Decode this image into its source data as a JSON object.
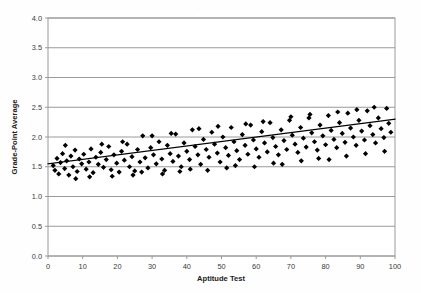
{
  "chart_data": {
    "type": "scatter",
    "title": "",
    "xlabel": "Aptitude Test",
    "ylabel": "Grade-Point Average",
    "xlim": [
      0,
      100
    ],
    "ylim": [
      0,
      4.0
    ],
    "xticks": [
      0,
      10,
      20,
      30,
      40,
      50,
      60,
      70,
      80,
      90,
      100
    ],
    "xtick_labels": [
      "0",
      "10",
      "20",
      "30",
      "40",
      "50",
      "60",
      "70",
      "80",
      "90",
      "100"
    ],
    "yticks": [
      0.0,
      0.5,
      1.0,
      1.5,
      2.0,
      2.5,
      3.0,
      3.5,
      4.0
    ],
    "ytick_labels": [
      "0.0",
      "0.5",
      "1.0",
      "1.5",
      "2.0",
      "2.5",
      "3.0",
      "3.5",
      "4.0"
    ],
    "grid": {
      "horizontal": true,
      "vertical": false,
      "color": "#9a9a9a"
    },
    "legend": {
      "visible": false,
      "position": "none"
    },
    "marker": {
      "shape": "diamond",
      "color": "#000000",
      "size": 2.6
    },
    "plot_border_color": "#9a9a9a",
    "background_color": "#ffffff",
    "trendline": {
      "visible": true,
      "type": "linear",
      "color": "#000000",
      "width": 1.1,
      "x_start": 0,
      "y_start": 1.55,
      "x_end": 100,
      "y_end": 2.3,
      "slope": 0.0075,
      "intercept": 1.55
    },
    "series": [
      {
        "name": "Students",
        "n_points": 162,
        "points": [
          [
            1.5,
            1.52
          ],
          [
            2.0,
            1.44
          ],
          [
            2.6,
            1.64
          ],
          [
            3.1,
            1.38
          ],
          [
            3.6,
            1.57
          ],
          [
            4.2,
            1.72
          ],
          [
            4.8,
            1.47
          ],
          [
            5.4,
            1.6
          ],
          [
            6.0,
            1.36
          ],
          [
            6.6,
            1.68
          ],
          [
            7.2,
            1.5
          ],
          [
            7.8,
            1.78
          ],
          [
            8.4,
            1.42
          ],
          [
            9.0,
            1.63
          ],
          [
            9.7,
            1.55
          ],
          [
            10.3,
            1.71
          ],
          [
            11.0,
            1.46
          ],
          [
            11.8,
            1.58
          ],
          [
            12.4,
            1.8
          ],
          [
            13.0,
            1.4
          ],
          [
            13.8,
            1.66
          ],
          [
            14.5,
            1.54
          ],
          [
            15.2,
            1.74
          ],
          [
            16.0,
            1.49
          ],
          [
            16.8,
            1.62
          ],
          [
            17.5,
            1.84
          ],
          [
            18.2,
            1.45
          ],
          [
            19.0,
            1.7
          ],
          [
            19.8,
            1.56
          ],
          [
            20.5,
            1.41
          ],
          [
            21.2,
            1.76
          ],
          [
            22.0,
            1.61
          ],
          [
            22.8,
            1.88
          ],
          [
            23.5,
            1.5
          ],
          [
            24.2,
            1.67
          ],
          [
            25.0,
            1.43
          ],
          [
            25.8,
            1.79
          ],
          [
            26.5,
            1.58
          ],
          [
            27.3,
            2.02
          ],
          [
            28.0,
            1.65
          ],
          [
            28.8,
            1.48
          ],
          [
            29.6,
            1.82
          ],
          [
            30.4,
            1.7
          ],
          [
            31.2,
            1.55
          ],
          [
            32.0,
            1.92
          ],
          [
            32.8,
            1.63
          ],
          [
            33.6,
            1.44
          ],
          [
            34.4,
            1.86
          ],
          [
            35.2,
            1.72
          ],
          [
            36.0,
            1.59
          ],
          [
            36.8,
            2.05
          ],
          [
            37.6,
            1.68
          ],
          [
            38.4,
            1.5
          ],
          [
            39.2,
            1.9
          ],
          [
            40.0,
            1.76
          ],
          [
            40.8,
            1.62
          ],
          [
            41.6,
            2.12
          ],
          [
            42.4,
            1.84
          ],
          [
            43.2,
            1.7
          ],
          [
            44.0,
            1.54
          ],
          [
            44.8,
            1.96
          ],
          [
            45.6,
            1.79
          ],
          [
            46.4,
            1.66
          ],
          [
            47.2,
            2.08
          ],
          [
            48.0,
            1.88
          ],
          [
            48.8,
            1.73
          ],
          [
            49.6,
            1.58
          ],
          [
            50.4,
            2.0
          ],
          [
            51.2,
            1.82
          ],
          [
            52.0,
            1.69
          ],
          [
            52.8,
            2.16
          ],
          [
            53.6,
            1.92
          ],
          [
            54.4,
            1.77
          ],
          [
            55.2,
            1.62
          ],
          [
            56.0,
            2.04
          ],
          [
            56.8,
            1.86
          ],
          [
            57.6,
            1.71
          ],
          [
            58.4,
            2.2
          ],
          [
            59.2,
            1.95
          ],
          [
            60.0,
            1.8
          ],
          [
            60.8,
            1.66
          ],
          [
            61.6,
            2.09
          ],
          [
            62.4,
            1.9
          ],
          [
            63.2,
            1.75
          ],
          [
            64.0,
            2.24
          ],
          [
            64.8,
            1.99
          ],
          [
            65.6,
            1.84
          ],
          [
            66.4,
            1.7
          ],
          [
            67.2,
            2.12
          ],
          [
            68.0,
            1.94
          ],
          [
            68.8,
            1.79
          ],
          [
            69.6,
            2.28
          ],
          [
            70.4,
            2.03
          ],
          [
            71.2,
            1.88
          ],
          [
            72.0,
            1.74
          ],
          [
            72.8,
            2.16
          ],
          [
            73.6,
            1.98
          ],
          [
            74.4,
            1.83
          ],
          [
            75.2,
            2.32
          ],
          [
            76.0,
            2.07
          ],
          [
            76.8,
            1.92
          ],
          [
            77.6,
            1.78
          ],
          [
            78.4,
            2.2
          ],
          [
            79.2,
            2.02
          ],
          [
            80.0,
            1.87
          ],
          [
            80.8,
            2.36
          ],
          [
            81.6,
            2.11
          ],
          [
            82.4,
            1.96
          ],
          [
            83.2,
            1.82
          ],
          [
            84.0,
            2.24
          ],
          [
            84.8,
            2.06
          ],
          [
            85.6,
            1.91
          ],
          [
            86.4,
            2.4
          ],
          [
            87.2,
            2.15
          ],
          [
            88.0,
            2.0
          ],
          [
            88.8,
            1.86
          ],
          [
            89.6,
            2.28
          ],
          [
            90.4,
            2.1
          ],
          [
            91.2,
            1.95
          ],
          [
            92.0,
            2.44
          ],
          [
            92.8,
            2.19
          ],
          [
            93.6,
            2.04
          ],
          [
            94.4,
            1.9
          ],
          [
            95.2,
            2.32
          ],
          [
            96.0,
            2.14
          ],
          [
            96.8,
            1.99
          ],
          [
            97.6,
            2.48
          ],
          [
            98.2,
            2.23
          ],
          [
            98.8,
            2.08
          ],
          [
            5.0,
            1.86
          ],
          [
            8.0,
            1.3
          ],
          [
            12.0,
            1.33
          ],
          [
            15.5,
            1.88
          ],
          [
            18.5,
            1.34
          ],
          [
            21.5,
            1.92
          ],
          [
            24.5,
            1.36
          ],
          [
            27.0,
            1.41
          ],
          [
            30.0,
            2.02
          ],
          [
            33.0,
            1.38
          ],
          [
            35.5,
            2.06
          ],
          [
            38.0,
            1.42
          ],
          [
            41.0,
            1.46
          ],
          [
            43.5,
            2.14
          ],
          [
            46.0,
            1.44
          ],
          [
            49.0,
            2.18
          ],
          [
            51.5,
            1.48
          ],
          [
            54.0,
            1.52
          ],
          [
            57.0,
            2.22
          ],
          [
            59.5,
            1.5
          ],
          [
            62.0,
            2.26
          ],
          [
            65.0,
            1.56
          ],
          [
            67.5,
            1.54
          ],
          [
            70.0,
            2.34
          ],
          [
            73.0,
            1.6
          ],
          [
            75.5,
            2.38
          ],
          [
            78.0,
            1.64
          ],
          [
            81.0,
            1.62
          ],
          [
            83.5,
            2.42
          ],
          [
            86.0,
            1.68
          ],
          [
            89.0,
            2.46
          ],
          [
            91.5,
            1.72
          ],
          [
            94.0,
            2.5
          ],
          [
            97.0,
            1.76
          ]
        ]
      }
    ]
  },
  "axes": {
    "y_title": "Grade-Point Average",
    "x_title": "Aptitude Test"
  }
}
